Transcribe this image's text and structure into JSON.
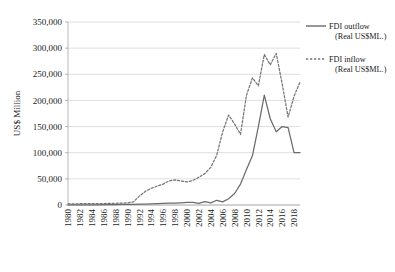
{
  "chart_data": {
    "type": "line",
    "title": "",
    "xlabel": "",
    "ylabel": "US$ Million",
    "ylim": [
      0,
      350000
    ],
    "ytick_step": 50000,
    "ytick_labels": [
      "0",
      "50,000",
      "100,000",
      "150,000",
      "200,000",
      "250,000",
      "300,000",
      "350,000"
    ],
    "ytick_values": [
      0,
      50000,
      100000,
      150000,
      200000,
      250000,
      300000,
      350000
    ],
    "grid": true,
    "legend_position": "right",
    "x": [
      1980,
      1981,
      1982,
      1983,
      1984,
      1985,
      1986,
      1987,
      1988,
      1989,
      1990,
      1991,
      1992,
      1993,
      1994,
      1995,
      1996,
      1997,
      1998,
      1999,
      2000,
      2001,
      2002,
      2003,
      2004,
      2005,
      2006,
      2007,
      2008,
      2009,
      2010,
      2011,
      2012,
      2013,
      2014,
      2015,
      2016,
      2017,
      2018,
      2019
    ],
    "xtick_labels": [
      "1980",
      "1982",
      "1984",
      "1986",
      "1988",
      "1990",
      "1992",
      "1994",
      "1996",
      "1998",
      "2000",
      "2002",
      "2004",
      "2006",
      "2008",
      "2010",
      "2012",
      "2014",
      "2016",
      "2018"
    ],
    "xtick_values": [
      1980,
      1982,
      1984,
      1986,
      1988,
      1990,
      1992,
      1994,
      1996,
      1998,
      2000,
      2002,
      2004,
      2006,
      2008,
      2010,
      2012,
      2014,
      2016,
      2018
    ],
    "series": [
      {
        "name": "FDI outflow (Real US$ML.)",
        "style": "solid",
        "color": "#6b6b6b",
        "values": [
          200,
          250,
          300,
          350,
          400,
          450,
          550,
          650,
          800,
          1000,
          1200,
          1400,
          1600,
          1900,
          2200,
          2600,
          3000,
          3400,
          3800,
          4200,
          4800,
          5200,
          3000,
          6500,
          4000,
          9000,
          6000,
          12000,
          22000,
          40000,
          68000,
          94000,
          150000,
          210000,
          165000,
          140000,
          150000,
          148000,
          100000,
          100000
        ]
      },
      {
        "name": "FDI inflow (Real US$ML.)",
        "style": "dashed",
        "color": "#757575",
        "values": [
          2000,
          2200,
          2400,
          2500,
          2600,
          2700,
          2800,
          3000,
          3300,
          3600,
          4000,
          6000,
          17000,
          26000,
          32000,
          36000,
          40000,
          46000,
          48000,
          46000,
          44000,
          47000,
          53000,
          60000,
          72000,
          95000,
          140000,
          172000,
          155000,
          135000,
          210000,
          243000,
          228000,
          288000,
          268000,
          290000,
          232000,
          168000,
          208000,
          235000
        ]
      }
    ],
    "series_annotation": {
      "outflow_peak_year": 2013,
      "outflow_peak_value": 210000,
      "inflow_peak_year": 2013,
      "inflow_peak_value": 288000
    }
  },
  "legend": {
    "items": [
      {
        "line1": "FDI outflow",
        "line2": "(Real US$ML.)",
        "style": "solid"
      },
      {
        "line1": "FDI inflow",
        "line2": "(Real US$ML.)",
        "style": "dashed"
      }
    ]
  },
  "colors": {
    "grid": "#d0d0d0",
    "axis": "#a6a6a6",
    "outflow": "#6b6b6b",
    "inflow": "#757575",
    "text": "#1a1a1a",
    "background": "#ffffff"
  }
}
